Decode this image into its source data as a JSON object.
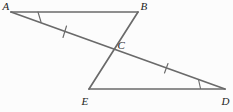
{
  "figure": {
    "width": 233,
    "height": 112,
    "background": "#fcfcfc",
    "line_color": "#6a6a6a",
    "label_color": "#1d1d1d",
    "line_width": 1.7,
    "mark_width": 1.15,
    "label_font_size": 11
  },
  "points": {
    "A": {
      "x": 11,
      "y": 12
    },
    "B": {
      "x": 138,
      "y": 12
    },
    "C": {
      "x": 114,
      "y": 49
    },
    "E": {
      "x": 89,
      "y": 89
    },
    "D": {
      "x": 225,
      "y": 89
    }
  },
  "segments": [
    {
      "name": "AB",
      "from": "A",
      "to": "B"
    },
    {
      "name": "AD",
      "from": "A",
      "to": "D"
    },
    {
      "name": "BE",
      "from": "B",
      "to": "E"
    },
    {
      "name": "ED",
      "from": "E",
      "to": "D"
    }
  ],
  "tick_marks": [
    {
      "name": "tick-mark-AC",
      "x1": 66.5,
      "y1": 26,
      "x2": 63,
      "y2": 37.5
    },
    {
      "name": "tick-mark-CD",
      "x1": 168,
      "y1": 63.5,
      "x2": 164.5,
      "y2": 73
    }
  ],
  "angle_marks": [
    {
      "name": "angle-mark-A",
      "x1": 38,
      "y1": 12,
      "x2": 41,
      "y2": 22
    },
    {
      "name": "angle-mark-D",
      "x1": 198.5,
      "y1": 79.5,
      "x2": 200.5,
      "y2": 88.5
    }
  ],
  "labels": [
    {
      "text": "A",
      "x": 2.5,
      "y": 9.5
    },
    {
      "text": "B",
      "x": 140.5,
      "y": 10
    },
    {
      "text": "C",
      "x": 117.5,
      "y": 48.5
    },
    {
      "text": "E",
      "x": 81.5,
      "y": 105
    },
    {
      "text": "D",
      "x": 221.5,
      "y": 105
    }
  ]
}
